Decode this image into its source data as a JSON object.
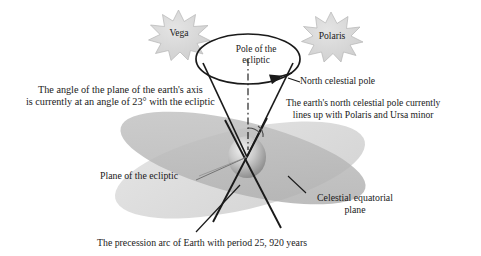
{
  "figure": {
    "title_internal": "Precession of the Earth's axis diagram",
    "background_color": "#ffffff",
    "line_color": "#1a1a1a",
    "plane_fill_light": "#dcdcdc",
    "plane_fill_dark": "#b8b8b8",
    "star_fill": "#d6d6d6",
    "star_stroke": "#b0b0b0",
    "earth_fill_light": "#e8e8e8",
    "earth_fill_dark": "#8e8e8e"
  },
  "stars": [
    {
      "name": "vega",
      "label": "Vega"
    },
    {
      "name": "polaris",
      "label": "Polaris"
    }
  ],
  "labels": {
    "axis_angle": "The angle of the plane of the earth's axis\nis currently at an angle of 23° with the ecliptic",
    "pole_of_the_ecliptic": "Pole of the\necliptic",
    "north_celestial_pole": "North celestial pole",
    "polaris_lineup": "The earth's north celestial pole currently\nlines up with Polaris and Ursa minor",
    "plane_of_the_ecliptic": "Plane of the ecliptic",
    "celestial_equatorial_plane": "Celestial equatorial\nplane",
    "precession_arc": "The precession arc of Earth with period 25, 920 years"
  },
  "annotations": {
    "tilt_angle_degrees": "23°",
    "precession_period_years": "25, 920"
  }
}
